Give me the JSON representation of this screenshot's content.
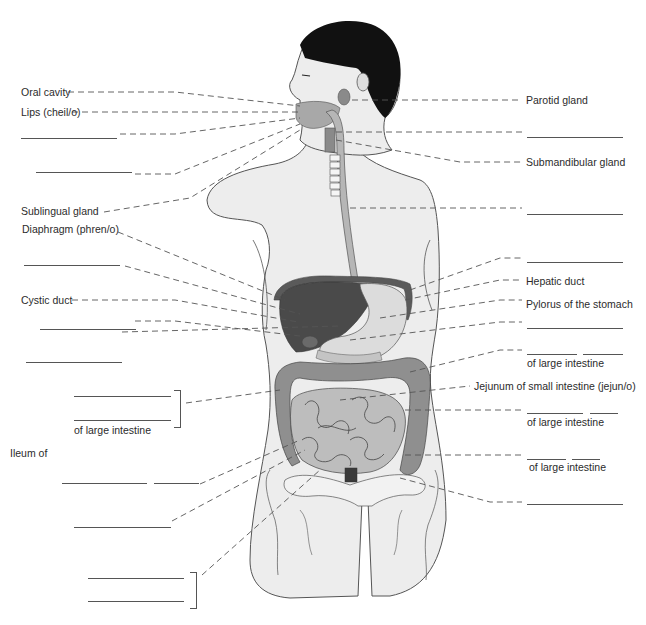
{
  "figure": {
    "colors": {
      "skin": "#ededed",
      "outline": "#555555",
      "hair": "#111111",
      "organ_dark": "#4a4a4a",
      "organ_mid": "#8a8a8a",
      "organ_light": "#c9c9c9",
      "leader": "#555555"
    }
  },
  "labels_left": [
    {
      "id": "oral-cavity",
      "text": "Oral cavity"
    },
    {
      "id": "lips",
      "text": "Lips (cheil/o)"
    },
    {
      "id": "sublingual-gland",
      "text": "Sublingual gland"
    },
    {
      "id": "diaphragm",
      "text": "Diaphragm (phren/o)"
    },
    {
      "id": "cystic-duct",
      "text": "Cystic duct"
    },
    {
      "id": "large-intestine-left",
      "text": "of large intestine"
    },
    {
      "id": "ileum",
      "text": "Ileum of"
    }
  ],
  "labels_right": [
    {
      "id": "parotid-gland",
      "text": "Parotid gland"
    },
    {
      "id": "submandibular-gland",
      "text": "Submandibular gland"
    },
    {
      "id": "hepatic-duct",
      "text": "Hepatic duct"
    },
    {
      "id": "pylorus",
      "text": "Pylorus of the stomach"
    },
    {
      "id": "large-intestine-r1",
      "text": "of large intestine"
    },
    {
      "id": "jejunum",
      "text": "Jejunum of small intestine (jejun/o)"
    },
    {
      "id": "large-intestine-r2",
      "text": "of large intestine"
    },
    {
      "id": "large-intestine-r3",
      "text": "of large intestine"
    }
  ]
}
